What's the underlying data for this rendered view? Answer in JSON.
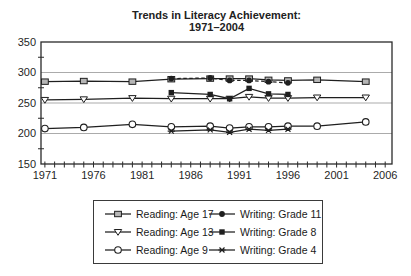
{
  "title": {
    "line1": "Trends in Literacy Achievement:",
    "line2": "1971–2004"
  },
  "chart_data": {
    "type": "line",
    "title": "Trends in Literacy Achievement:",
    "subtitle": "1971–2004",
    "xlabel": "",
    "ylabel": "",
    "xlim": [
      1970.6,
      2006.7
    ],
    "ylim": [
      150,
      350
    ],
    "xtick_labels": [
      1971,
      1976,
      1981,
      1986,
      1991,
      1996,
      2001,
      2006
    ],
    "xtick_minor_years": {
      "start": 1971,
      "end": 2006,
      "step": 1
    },
    "ytick_labels": [
      150,
      200,
      250,
      300,
      350
    ],
    "ytick_minor": [
      175,
      225,
      275,
      325
    ],
    "gridlines_y": [
      200,
      250,
      300
    ],
    "grid": "horizontal-only",
    "legend_position": "bottom-box",
    "series": [
      {
        "name": "Reading: Age 17",
        "marker": "square-open",
        "line_style": "solid",
        "x": [
          1971,
          1975,
          1980,
          1984,
          1988,
          1990,
          1992,
          1994,
          1996,
          1999,
          2004
        ],
        "values": [
          285,
          286,
          285,
          289,
          290,
          290,
          290,
          288,
          287,
          288,
          285
        ]
      },
      {
        "name": "Reading: Age 13",
        "marker": "triangle-open",
        "line_style": "solid",
        "x": [
          1971,
          1975,
          1980,
          1984,
          1988,
          1990,
          1992,
          1994,
          1996,
          1999,
          2004
        ],
        "values": [
          255,
          256,
          258,
          257,
          257,
          257,
          260,
          258,
          258,
          259,
          259
        ]
      },
      {
        "name": "Reading: Age 9",
        "marker": "circle-open",
        "line_style": "solid",
        "x": [
          1971,
          1975,
          1980,
          1984,
          1988,
          1990,
          1992,
          1994,
          1996,
          1999,
          2004
        ],
        "values": [
          208,
          210,
          215,
          211,
          212,
          209,
          211,
          211,
          212,
          212,
          219
        ]
      },
      {
        "name": "Writing: Grade 11",
        "marker": "circle-filled",
        "line_style": "dashed",
        "x": [
          1984,
          1988,
          1990,
          1992,
          1994,
          1996
        ],
        "values": [
          290,
          291,
          287,
          287,
          285,
          283
        ]
      },
      {
        "name": "Writing: Grade 8",
        "marker": "square-filled",
        "line_style": "solid",
        "x": [
          1984,
          1988,
          1990,
          1992,
          1994,
          1996
        ],
        "values": [
          267,
          264,
          257,
          274,
          265,
          264
        ]
      },
      {
        "name": "Writing: Grade 4",
        "marker": "star",
        "line_style": "solid",
        "x": [
          1984,
          1988,
          1990,
          1992,
          1994,
          1996
        ],
        "values": [
          204,
          206,
          202,
          207,
          205,
          207
        ]
      }
    ]
  },
  "colors": {
    "line": "#1f1f1f",
    "axis": "#2a2a2a",
    "grid": "#ababab",
    "marker_gray_fill": "#b5b5b5",
    "background": "#ffffff"
  }
}
